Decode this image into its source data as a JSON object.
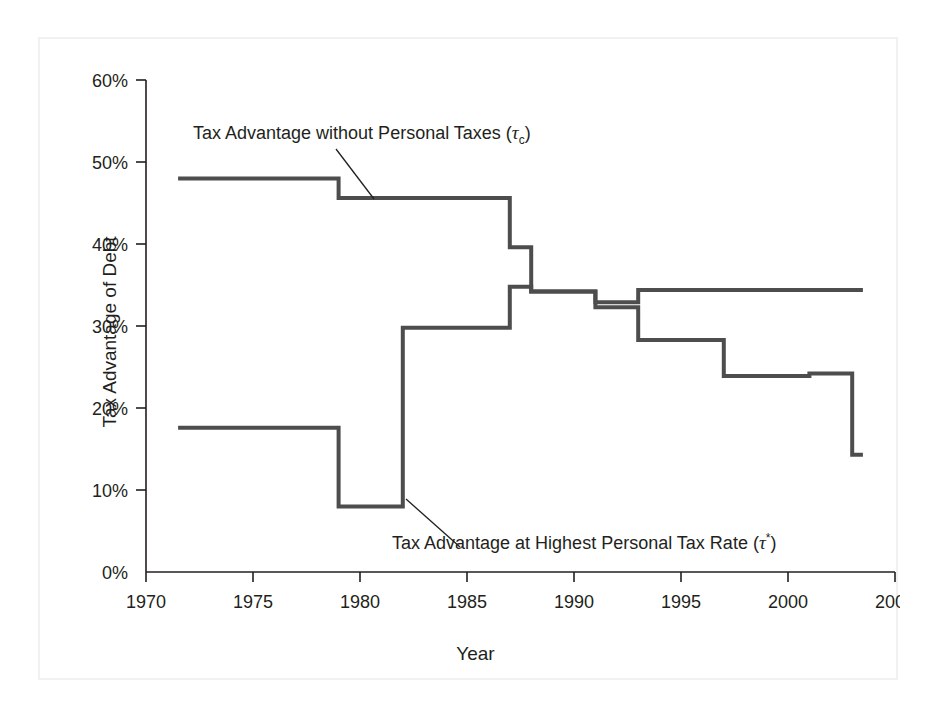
{
  "figure": {
    "background_color": "#ffffff",
    "frame_color": "#f1f1f1",
    "line_color": "#4d4d4d",
    "axis_color": "#231f20"
  },
  "axes": {
    "ylabel": "Tax Advantage of Debt",
    "xlabel": "Year",
    "y_ticks": [
      "0%",
      "10%",
      "20%",
      "30%",
      "40%",
      "50%",
      "60%"
    ],
    "x_ticks": [
      "1970",
      "1975",
      "1980",
      "1985",
      "1990",
      "1995",
      "2000",
      "2005"
    ]
  },
  "annotations": {
    "upper_label_prefix": "Tax Advantage without Personal Taxes (",
    "upper_label_tau": "τ",
    "upper_label_sub": "c",
    "upper_label_suffix": ")",
    "lower_label_prefix": "Tax Advantage at Highest Personal Tax Rate (",
    "lower_label_tau": "τ",
    "lower_label_sub": "*",
    "lower_label_suffix": ")"
  },
  "chart_data": {
    "type": "line",
    "subtype": "step",
    "title": "",
    "xlabel": "Year",
    "ylabel": "Tax Advantage of Debt",
    "xlim": [
      1970,
      2005
    ],
    "ylim": [
      0,
      60
    ],
    "y_tick_values": [
      0,
      10,
      20,
      30,
      40,
      50,
      60
    ],
    "x_tick_values": [
      1970,
      1975,
      1980,
      1985,
      1990,
      1995,
      2000,
      2005
    ],
    "grid": false,
    "legend": "inline-annotations",
    "y_unit": "percent",
    "series": [
      {
        "name": "Tax Advantage without Personal Taxes (τc)",
        "step_points": [
          {
            "year": 1971.5,
            "value": 48.0
          },
          {
            "year": 1979.0,
            "value": 48.0
          },
          {
            "year": 1979.0,
            "value": 45.6
          },
          {
            "year": 1987.0,
            "value": 45.6
          },
          {
            "year": 1987.0,
            "value": 39.6
          },
          {
            "year": 1988.0,
            "value": 39.6
          },
          {
            "year": 1988.0,
            "value": 34.2
          },
          {
            "year": 1991.0,
            "value": 34.2
          },
          {
            "year": 1991.0,
            "value": 32.9
          },
          {
            "year": 1993.0,
            "value": 32.9
          },
          {
            "year": 1993.0,
            "value": 34.4
          },
          {
            "year": 2003.5,
            "value": 34.4
          }
        ]
      },
      {
        "name": "Tax Advantage at Highest Personal Tax Rate (τ*)",
        "step_points": [
          {
            "year": 1971.5,
            "value": 17.6
          },
          {
            "year": 1979.0,
            "value": 17.6
          },
          {
            "year": 1979.0,
            "value": 8.0
          },
          {
            "year": 1982.0,
            "value": 8.0
          },
          {
            "year": 1982.0,
            "value": 29.8
          },
          {
            "year": 1987.0,
            "value": 29.8
          },
          {
            "year": 1987.0,
            "value": 34.8
          },
          {
            "year": 1988.0,
            "value": 34.8
          },
          {
            "year": 1988.0,
            "value": 34.2
          },
          {
            "year": 1991.0,
            "value": 34.2
          },
          {
            "year": 1991.0,
            "value": 32.3
          },
          {
            "year": 1993.0,
            "value": 32.3
          },
          {
            "year": 1993.0,
            "value": 28.3
          },
          {
            "year": 1997.0,
            "value": 28.3
          },
          {
            "year": 1997.0,
            "value": 23.9
          },
          {
            "year": 2001.0,
            "value": 23.9
          },
          {
            "year": 2001.0,
            "value": 24.2
          },
          {
            "year": 2003.0,
            "value": 24.2
          },
          {
            "year": 2003.0,
            "value": 14.3
          },
          {
            "year": 2003.5,
            "value": 14.3
          }
        ]
      }
    ]
  }
}
